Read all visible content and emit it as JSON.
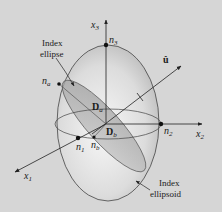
{
  "figure": {
    "background": "#d6d6d6",
    "ellipsoid_fill": "#e4e4e4",
    "index_ellipse_fill": "#a9a9a9",
    "line_color": "#333333",
    "labels": {
      "x1": "x",
      "x1_sub": "1",
      "x2": "x",
      "x2_sub": "2",
      "x3": "x",
      "x3_sub": "3",
      "u": "û",
      "n1": "n",
      "n1_sub": "1",
      "n2": "n",
      "n2_sub": "2",
      "n3": "n",
      "n3_sub": "3",
      "na": "n",
      "na_sub": "a",
      "nb": "n",
      "nb_sub": "b",
      "Da": "D",
      "Da_sub": "a",
      "Db": "D",
      "Db_sub": "b",
      "index_ellipse_line1": "Index",
      "index_ellipse_line2": "ellipse",
      "index_ellipsoid_line1": "Index",
      "index_ellipsoid_line2": "ellipsoid"
    }
  }
}
